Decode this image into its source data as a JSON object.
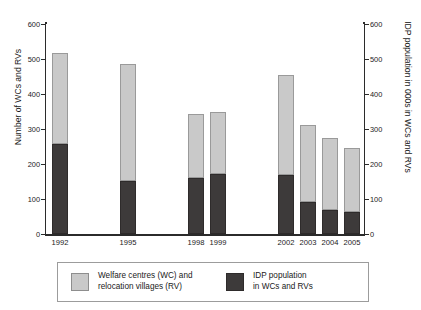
{
  "chart_data": {
    "type": "bar",
    "stacked": true,
    "title": "",
    "xlabel": "",
    "ylabel": "Number of  WCs and RVs",
    "ylabel_right": "IDP population in 000s in WCs and RVs",
    "ylim": [
      0,
      600
    ],
    "yticks": [
      0,
      100,
      200,
      300,
      400,
      500,
      600
    ],
    "ytick_labels": [
      "0",
      "100",
      "200",
      "300",
      "400",
      "500",
      "600"
    ],
    "ytick_labels_right": [
      "0",
      "100",
      "200",
      "300",
      "400",
      "500",
      "600"
    ],
    "grid": true,
    "legend_position": "bottom",
    "categories": [
      "1992",
      "1995",
      "1998",
      "1999",
      "2002",
      "2003",
      "2004",
      "2005"
    ],
    "series": [
      {
        "name": "IDP population in WCs and RVs",
        "color": "#3d3a3a",
        "values": [
          257,
          152,
          160,
          171,
          170,
          92,
          68,
          63
        ]
      },
      {
        "name": "Welfare centres (WC) and relocation villages (RV)",
        "color": "#c9c9c9",
        "values": [
          260,
          333,
          182,
          177,
          285,
          220,
          206,
          183
        ]
      }
    ],
    "totals": [
      517,
      485,
      342,
      348,
      455,
      312,
      274,
      246
    ]
  },
  "axes": {
    "left_title": "Number of  WCs and RVs",
    "right_title": "IDP population in 000s in WCs and RVs",
    "ticks": [
      "600",
      "500",
      "400",
      "300",
      "200",
      "100",
      "0"
    ]
  },
  "xaxis": {
    "labels": [
      "1992",
      "1995",
      "1998",
      "1999",
      "2002",
      "2003",
      "2004",
      "2005"
    ]
  },
  "legend": {
    "entries": [
      {
        "label": "Welfare centres (WC) and\nrelocation villages (RV)",
        "color": "#c9c9c9"
      },
      {
        "label": "IDP population\nin WCs and RVs",
        "color": "#3d3a3a"
      }
    ]
  }
}
